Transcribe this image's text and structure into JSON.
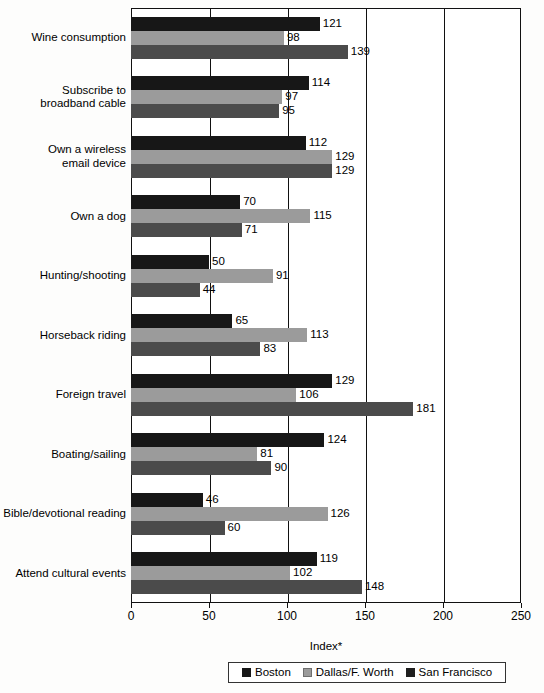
{
  "chart_data": {
    "type": "bar",
    "orientation": "horizontal",
    "title": "",
    "xlabel": "Index*",
    "ylabel": "",
    "xlim": [
      0,
      250
    ],
    "xticks": [
      0,
      50,
      100,
      150,
      200,
      250
    ],
    "grid": true,
    "legend_position": "bottom",
    "categories": [
      "Wine consumption",
      "Subscribe to\nbroadband cable",
      "Own a wireless\nemail device",
      "Own a dog",
      "Hunting/shooting",
      "Horseback riding",
      "Foreign travel",
      "Boating/sailing",
      "Bible/devotional reading",
      "Attend cultural events"
    ],
    "series": [
      {
        "name": "Boston",
        "color": "#171717",
        "values": [
          121,
          114,
          112,
          70,
          50,
          65,
          129,
          124,
          46,
          119
        ]
      },
      {
        "name": "Dallas/F. Worth",
        "color": "#9b9b9b",
        "values": [
          98,
          97,
          129,
          115,
          91,
          113,
          106,
          81,
          126,
          102
        ]
      },
      {
        "name": "San Francisco",
        "color": "#4b4b4b",
        "values": [
          139,
          95,
          129,
          71,
          44,
          83,
          181,
          90,
          60,
          148
        ]
      }
    ]
  },
  "legend": {
    "items": [
      {
        "label": "Boston"
      },
      {
        "label": "Dallas/F. Worth"
      },
      {
        "label": "San Francisco"
      }
    ]
  }
}
